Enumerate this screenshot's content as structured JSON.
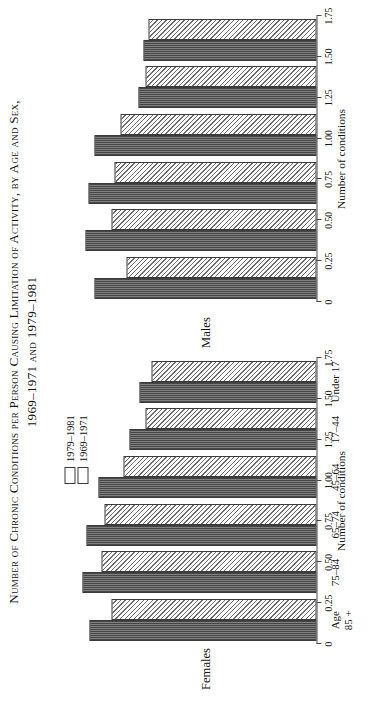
{
  "figure": {
    "title_line1": "Number of Chronic Conditions per Person Causing Limitation of Activity, by Age and Sex,",
    "title_line2": "1969–1971 and 1979–1981"
  },
  "legend": {
    "position": "top-right of left panel",
    "items": [
      {
        "label": "1979–1981",
        "pattern": "checker",
        "swatch_name": "legend-swatch-1979-1981"
      },
      {
        "label": "1969–1971",
        "pattern": "diagonal-hatch",
        "swatch_name": "legend-swatch-1969-1971"
      }
    ]
  },
  "axis": {
    "title": "Number of conditions",
    "ticks": [
      "0",
      "0.25",
      "0.50",
      "0.75",
      "1.00",
      "1.25",
      "1.50",
      "1.75"
    ]
  },
  "panels": [
    {
      "key": "females",
      "label": "Females"
    },
    {
      "key": "males",
      "label": "Males"
    }
  ],
  "chart_data": {
    "type": "bar",
    "title": "Number of Chronic Conditions per Person Causing Limitation of Activity, by Age and Sex, 1969–1971 and 1979–1981",
    "xlabel": "",
    "ylabel": "Number of conditions",
    "ylim": [
      0,
      1.75
    ],
    "yticks": [
      0,
      0.25,
      0.5,
      0.75,
      1.0,
      1.25,
      1.5,
      1.75
    ],
    "grid": false,
    "legend_position": "inside-top-right",
    "orientation": "vertical-bars-rotated-90",
    "categories": [
      "Age\n85 +",
      "75–84",
      "65–74",
      "45–64",
      "17–44",
      "Under 17"
    ],
    "category_labels": [
      "Age 85 +",
      "75–84",
      "65–74",
      "45–64",
      "17–44",
      "Under 17"
    ],
    "panels": [
      {
        "name": "Females",
        "series": [
          {
            "name": "1979–1981",
            "values": [
              1.55,
              1.6,
              1.57,
              1.49,
              1.28,
              1.21
            ]
          },
          {
            "name": "1969–1971",
            "values": [
              1.4,
              1.47,
              1.45,
              1.32,
              1.17,
              1.13
            ]
          }
        ]
      },
      {
        "name": "Males",
        "series": [
          {
            "name": "1979–1981",
            "values": [
              1.52,
              1.58,
              1.56,
              1.52,
              1.22,
              1.18
            ]
          },
          {
            "name": "1969–1971",
            "values": [
              1.3,
              1.4,
              1.38,
              1.34,
              1.17,
              1.15
            ]
          }
        ]
      }
    ]
  }
}
